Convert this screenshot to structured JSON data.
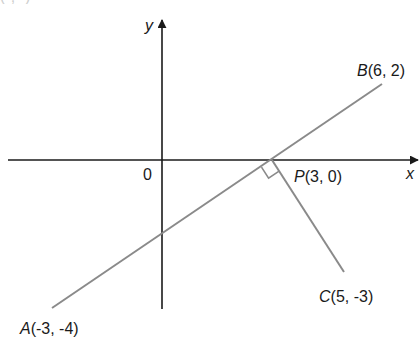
{
  "top_fragment": "(-, -)",
  "axes": {
    "x_label": "x",
    "y_label": "y",
    "origin_label": "0",
    "axis_color": "#1a1a1a"
  },
  "points": {
    "A": {
      "name": "A",
      "coords": "(-3, -4)",
      "x": -3,
      "y": -4
    },
    "B": {
      "name": "B",
      "coords": "(6, 2)",
      "x": 6,
      "y": 2
    },
    "C": {
      "name": "C",
      "coords": "(5, -3)",
      "x": 5,
      "y": -3
    },
    "P": {
      "name": "P",
      "coords": "(3, 0)",
      "x": 3,
      "y": 0
    }
  },
  "segments": [
    {
      "from": "A",
      "to": "B",
      "color": "#8a8a8a"
    },
    {
      "from": "P",
      "to": "C",
      "color": "#8a8a8a"
    }
  ],
  "annotations": {
    "right_angle_at": "P",
    "right_angle_between": [
      "AB",
      "PC"
    ]
  }
}
